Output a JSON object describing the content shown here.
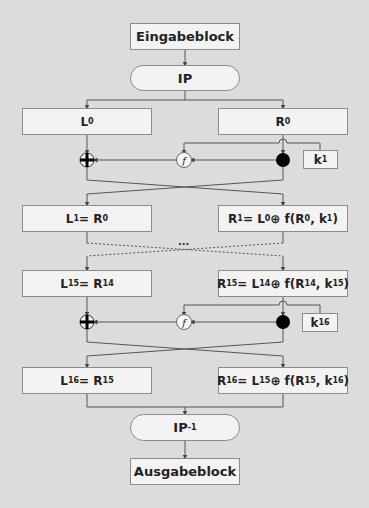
{
  "diagram": {
    "input_block": "Eingabeblock",
    "initial_permutation": {
      "base": "IP",
      "sup": ""
    },
    "final_permutation": {
      "base": "IP",
      "sup": "-1"
    },
    "output_block": "Ausgabeblock",
    "ellipsis": "...",
    "function_label": "f",
    "rounds": [
      {
        "left": {
          "parts": [
            [
              "L",
              "0"
            ]
          ]
        },
        "right": {
          "parts": [
            [
              "R",
              "0"
            ]
          ]
        }
      },
      {
        "left": {
          "parts": [
            [
              "L",
              "1"
            ],
            [
              " = ",
              ""
            ],
            [
              "R",
              "0"
            ]
          ]
        },
        "right": {
          "parts": [
            [
              "R",
              "1"
            ],
            [
              " = ",
              ""
            ],
            [
              "L",
              "0"
            ],
            [
              " ⊕ f(",
              ""
            ],
            [
              "R",
              "0"
            ],
            [
              ", ",
              ""
            ],
            [
              "k",
              "1"
            ],
            [
              ")",
              ""
            ]
          ]
        }
      },
      {
        "left": {
          "parts": [
            [
              "L",
              "15"
            ],
            [
              " = ",
              ""
            ],
            [
              "R",
              "14"
            ]
          ]
        },
        "right": {
          "parts": [
            [
              "R",
              "15"
            ],
            [
              " = ",
              ""
            ],
            [
              "L",
              "14"
            ],
            [
              " ⊕ f(",
              ""
            ],
            [
              "R",
              "14"
            ],
            [
              ", ",
              ""
            ],
            [
              "k",
              "15"
            ],
            [
              ")",
              ""
            ]
          ]
        }
      },
      {
        "left": {
          "parts": [
            [
              "L",
              "16"
            ],
            [
              " = ",
              ""
            ],
            [
              "R",
              "15"
            ]
          ]
        },
        "right": {
          "parts": [
            [
              "R",
              "16"
            ],
            [
              " = ",
              ""
            ],
            [
              "L",
              "15"
            ],
            [
              " ⊕ f(",
              ""
            ],
            [
              "R",
              "15"
            ],
            [
              ", ",
              ""
            ],
            [
              "k",
              "16"
            ],
            [
              ")",
              ""
            ]
          ]
        }
      }
    ],
    "keys": [
      {
        "parts": [
          [
            "k",
            "1"
          ]
        ]
      },
      {
        "parts": [
          [
            "k",
            "16"
          ]
        ]
      }
    ],
    "colors": {
      "background": "#dcdcdc",
      "box_fill": "#f3f3f3",
      "box_border": "#8c8c8c",
      "line": "#555555",
      "dot": "#000000"
    }
  }
}
